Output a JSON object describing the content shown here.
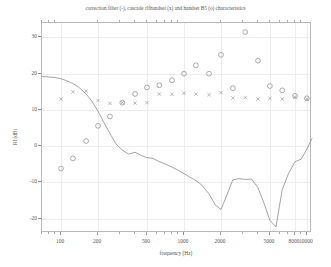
{
  "figure": {
    "title": "correction filter (-), cascade rlfhandset (x) and handset B5 (o) characteristics",
    "x_axis_title": "frequency (Hz)",
    "y_axis_title": "RI (dB)"
  },
  "chart_data": {
    "type": "line",
    "title": "correction filter (-), cascade rlfhandset (x) and handset B5 (o) characteristics",
    "xlabel": "frequency (Hz)",
    "ylabel": "RI (dB)",
    "xscale": "log",
    "xlim": [
      70,
      11000
    ],
    "ylim": [
      -24,
      34
    ],
    "grid": true,
    "legend": "none",
    "x_ticks": [
      100,
      200,
      500,
      1000,
      2000,
      5000,
      8000,
      10000
    ],
    "x_tick_labels": [
      "100",
      "200",
      "500",
      "1000",
      "2000",
      "5000",
      "8000",
      "10000"
    ],
    "y_ticks": [
      30,
      20,
      10,
      0,
      -10,
      -20
    ],
    "y_tick_labels": [
      "30",
      "20",
      "10",
      "0",
      "-10",
      "-20"
    ],
    "series": [
      {
        "name": "correction filter",
        "marker": "line",
        "style": "solid",
        "color": "#7d7d7d",
        "x": [
          70,
          80,
          90,
          100,
          110,
          125,
          140,
          160,
          180,
          200,
          220,
          250,
          280,
          315,
          355,
          400,
          450,
          500,
          560,
          630,
          710,
          800,
          900,
          1000,
          1120,
          1250,
          1400,
          1600,
          1800,
          2000,
          2240,
          2500,
          2800,
          3150,
          3550,
          4000,
          4500,
          5000,
          5600,
          6300,
          7100,
          8000,
          9000,
          10000,
          11000
        ],
        "y": [
          19.2,
          19.1,
          18.9,
          18.6,
          18.1,
          17.3,
          16.2,
          14.4,
          12.2,
          9.6,
          6.9,
          3.5,
          0.6,
          -1.1,
          -2.2,
          -1.7,
          -2.6,
          -3.2,
          -3.4,
          -4.3,
          -5.0,
          -5.8,
          -6.7,
          -7.6,
          -8.6,
          -9.5,
          -10.8,
          -13.2,
          -16.3,
          -17.5,
          -13.4,
          -9.3,
          -9.0,
          -9.2,
          -9.1,
          -11.5,
          -16.0,
          -20.5,
          -22.3,
          -12.0,
          -7.5,
          -4.3,
          -3.6,
          -0.8,
          2.1
        ]
      },
      {
        "name": "cascade rlfhandset",
        "marker": "x",
        "color": "#8a8a8a",
        "x": [
          100,
          125,
          160,
          200,
          250,
          315,
          400,
          500,
          630,
          800,
          1000,
          1250,
          1600,
          2000,
          2500,
          3150,
          4000,
          5000,
          6300,
          8000,
          10000
        ],
        "y": [
          13.0,
          15.0,
          15.2,
          12.6,
          11.8,
          12.0,
          11.9,
          12.0,
          14.4,
          14.3,
          14.6,
          14.4,
          14.2,
          14.8,
          13.3,
          13.4,
          13.0,
          13.2,
          13.0,
          13.5,
          13.0
        ]
      },
      {
        "name": "handset B5",
        "marker": "o",
        "color": "#8a8a8a",
        "x": [
          100,
          125,
          160,
          200,
          250,
          315,
          400,
          500,
          630,
          800,
          1000,
          1250,
          1600,
          2000,
          2500,
          3150,
          4000,
          5000,
          6300,
          8000,
          10000
        ],
        "y": [
          -6.2,
          -3.4,
          1.4,
          5.6,
          8.2,
          12.0,
          14.4,
          16.2,
          16.8,
          18.2,
          20.0,
          22.3,
          20.0,
          25.2,
          16.0,
          31.5,
          23.6,
          16.6,
          15.4,
          13.9,
          13.2
        ]
      }
    ]
  }
}
